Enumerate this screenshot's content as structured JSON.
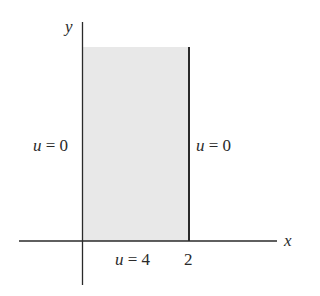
{
  "diagram": {
    "type": "boundary-value-region",
    "axes": {
      "x_label": "x",
      "y_label": "y"
    },
    "region": {
      "description": "semi-infinite strip 0 < x < 2, y > 0",
      "fill_color": "#e8e8e8",
      "edge_color": "#2a2a2a"
    },
    "tick_labels": {
      "x_right": "2"
    },
    "boundary_conditions": {
      "left": {
        "var": "u",
        "eq": " = ",
        "value": "0"
      },
      "right": {
        "var": "u",
        "eq": " = ",
        "value": "0"
      },
      "bottom": {
        "var": "u",
        "eq": " = ",
        "value": "4"
      }
    }
  }
}
